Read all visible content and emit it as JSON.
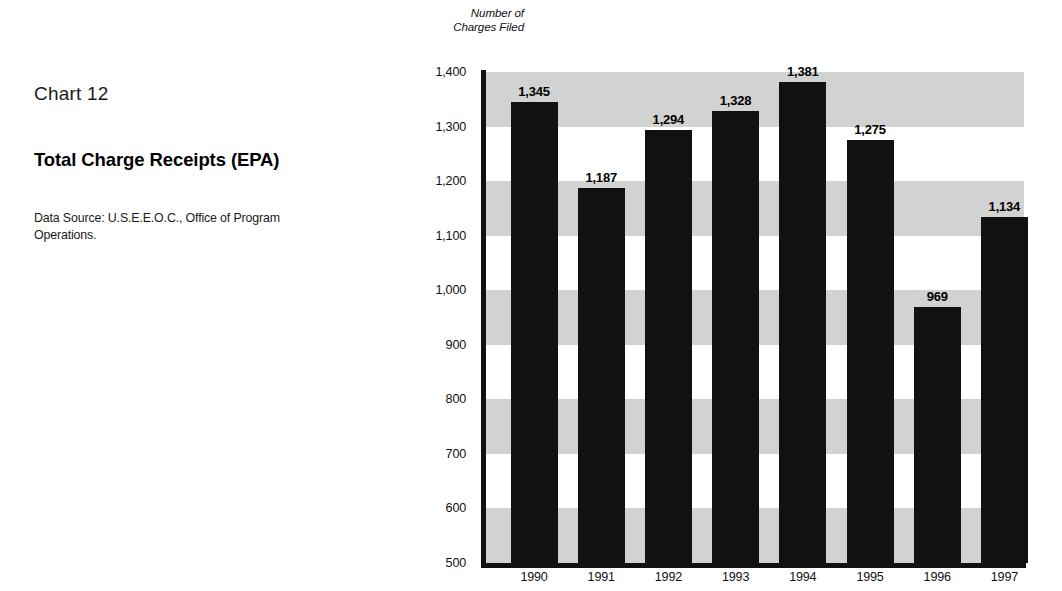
{
  "caption": {
    "chart_number": "Chart 12",
    "title": "Total Charge Receipts (EPA)",
    "data_source": "Data Source: U.S.E.E.O.C., Office of Program Operations."
  },
  "chart_data": {
    "type": "bar",
    "title": "Total Charge Receipts (EPA)",
    "chart_number": "Chart 12",
    "xlabel": "",
    "ylabel": "Number of Charges Filed",
    "ylabel_lines": [
      "Number of",
      "Charges Filed"
    ],
    "categories": [
      "1990",
      "1991",
      "1992",
      "1993",
      "1994",
      "1995",
      "1996",
      "1997"
    ],
    "values": [
      1345,
      1187,
      1294,
      1328,
      1381,
      1275,
      969,
      1134
    ],
    "value_labels": [
      "1,345",
      "1,187",
      "1,294",
      "1,328",
      "1,381",
      "1,275",
      "969",
      "1,134"
    ],
    "ylim": [
      500,
      1400
    ],
    "ytick_values": [
      1400,
      1300,
      1200,
      1100,
      1000,
      900,
      800,
      700,
      600,
      500
    ],
    "ytick_labels": [
      "1,400",
      "1,300",
      "1,200",
      "1,100",
      "1,000",
      "900",
      "800",
      "700",
      "600",
      "500"
    ],
    "grid": false,
    "banded_background": true,
    "band_color": "#d2d2d2",
    "bar_color": "#111111",
    "legend": null,
    "source_note": "Data Source: U.S.E.E.O.C., Office of Program Operations."
  }
}
